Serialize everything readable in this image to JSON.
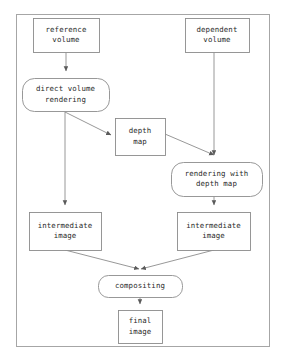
{
  "figure": {
    "kind": "flowchart",
    "orientation": "top-to-bottom",
    "border_color": "#9a9a9a",
    "node_stroke_color": "#8c8c8c",
    "edge_color": "#8c8c8c",
    "text_color": "#2b2b2b",
    "background": "#ffffff"
  },
  "nodes": [
    {
      "id": "reference-volume",
      "shape": "rectangle",
      "lines": [
        "reference",
        "volume"
      ],
      "x": 33,
      "y": 18,
      "w": 66,
      "h": 34
    },
    {
      "id": "dependent-volume",
      "shape": "rectangle",
      "lines": [
        "dependent",
        "volume"
      ],
      "x": 185,
      "y": 18,
      "w": 64,
      "h": 34
    },
    {
      "id": "direct-volume-rendering",
      "shape": "rounded",
      "lines": [
        "direct volume",
        "rendering"
      ],
      "x": 22,
      "y": 78,
      "w": 87,
      "h": 33
    },
    {
      "id": "depth-map",
      "shape": "rectangle",
      "lines": [
        "depth",
        "map"
      ],
      "x": 115,
      "y": 118,
      "w": 50,
      "h": 37
    },
    {
      "id": "rendering-with-depth-map",
      "shape": "rounded",
      "lines": [
        "rendering with",
        "depth map"
      ],
      "x": 171,
      "y": 162,
      "w": 91,
      "h": 34
    },
    {
      "id": "intermediate-image-left",
      "shape": "rectangle",
      "lines": [
        "intermediate",
        "image"
      ],
      "x": 29,
      "y": 212,
      "w": 72,
      "h": 38
    },
    {
      "id": "intermediate-image-right",
      "shape": "rectangle",
      "lines": [
        "intermediate",
        "image"
      ],
      "x": 177,
      "y": 212,
      "w": 73,
      "h": 38
    },
    {
      "id": "compositing",
      "shape": "rounded",
      "lines": [
        "compositing"
      ],
      "x": 98,
      "y": 275,
      "w": 84,
      "h": 22
    },
    {
      "id": "final-image",
      "shape": "rectangle",
      "lines": [
        "final",
        "image"
      ],
      "x": 118,
      "y": 310,
      "w": 44,
      "h": 33
    }
  ],
  "edges": [
    {
      "id": "reference-volume-to-direct-volume-rendering",
      "from": "reference-volume",
      "to": "direct-volume-rendering",
      "points": "66,52 66,72"
    },
    {
      "id": "direct-volume-rendering-to-depth-map",
      "from": "direct-volume-rendering",
      "to": "depth-map",
      "points": "65,111 113,136"
    },
    {
      "id": "direct-volume-rendering-to-intermediate-image-left",
      "from": "direct-volume-rendering",
      "to": "intermediate-image-left",
      "points": "65,111 65,206"
    },
    {
      "id": "depth-map-to-rendering-with-depth-map",
      "from": "depth-map",
      "to": "rendering-with-depth-map",
      "points": "165,134 214,156"
    },
    {
      "id": "dependent-volume-to-rendering-with-depth-map",
      "from": "dependent-volume",
      "to": "rendering-with-depth-map",
      "points": "214,52 214,156"
    },
    {
      "id": "rendering-with-depth-map-to-intermediate-image-right",
      "from": "rendering-with-depth-map",
      "to": "intermediate-image-right",
      "points": "214,196 214,206"
    },
    {
      "id": "intermediate-image-left-to-compositing",
      "from": "intermediate-image-left",
      "to": "compositing",
      "points": "65,250 140,270"
    },
    {
      "id": "intermediate-image-right-to-compositing",
      "from": "intermediate-image-right",
      "to": "compositing",
      "points": "214,250 140,270"
    },
    {
      "id": "compositing-to-final-image",
      "from": "compositing",
      "to": "final-image",
      "points": "140,297 140,305"
    }
  ],
  "border": {
    "x": 16,
    "y": 14,
    "w": 253,
    "h": 332
  }
}
